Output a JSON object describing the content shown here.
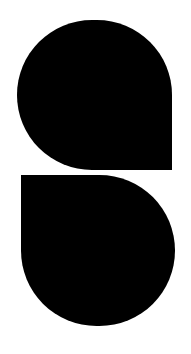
{
  "logo": {
    "shapes": [
      {
        "name": "top-teardrop",
        "color": "#000000",
        "square_corner": "bottom-right"
      },
      {
        "name": "bottom-teardrop",
        "color": "#000000",
        "square_corner": "top-left"
      }
    ]
  },
  "background": "#ffffff"
}
